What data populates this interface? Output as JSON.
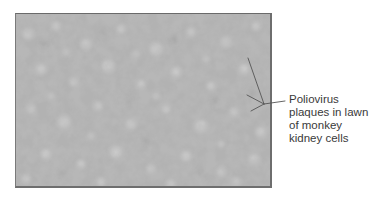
{
  "figure": {
    "image_description": "Micrograph of monkey kidney cell lawn with lighter poliovirus plaques",
    "colors": {
      "background": "#ffffff",
      "photo_base": "#b4b4b4",
      "plaque_light": "#d4d4d4",
      "shadow_dark": "#9c9c9c",
      "leader_line": "#555555",
      "label_text": "#3a3a3a"
    },
    "callout": {
      "lines": [
        "Poliovirus",
        "plaques in lawn",
        "of monkey",
        "kidney cells"
      ]
    }
  }
}
